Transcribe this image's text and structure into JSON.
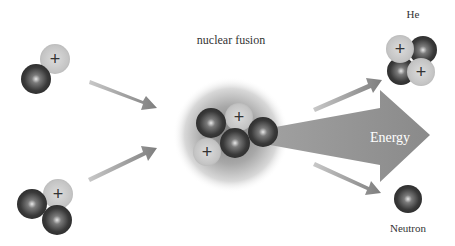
{
  "diagram": {
    "title": "nuclear fusion",
    "labels": {
      "product_helium": "He",
      "energy": "Energy",
      "product_neutron": "Neutron"
    },
    "particles": {
      "proton_symbol": "+",
      "proton_color": "#c8c8c8",
      "neutron_color": "#3c3c3c"
    },
    "reactants": [
      {
        "name": "deuterium",
        "protons": 1,
        "neutrons": 1
      },
      {
        "name": "tritium",
        "protons": 1,
        "neutrons": 2
      }
    ],
    "products": [
      {
        "name": "He",
        "protons": 2,
        "neutrons": 2
      },
      {
        "name": "Neutron",
        "protons": 0,
        "neutrons": 1
      }
    ],
    "arrow_color": "#8a8a8a"
  }
}
